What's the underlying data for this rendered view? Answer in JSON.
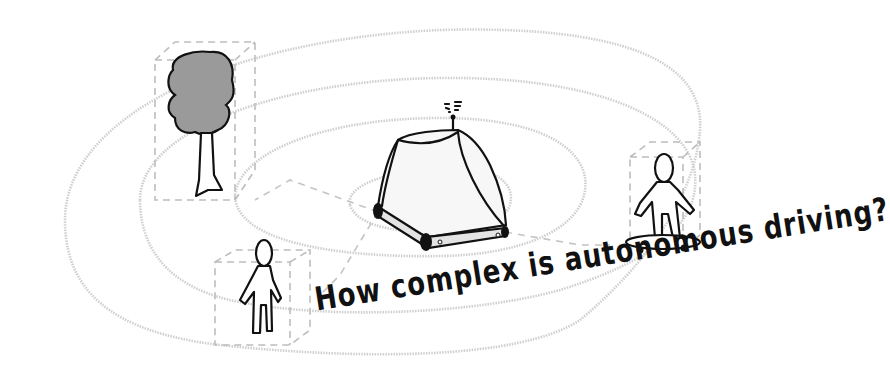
{
  "illustration": {
    "title": "How complex is autonomous driving?",
    "colors": {
      "background": "#ffffff",
      "ink": "#111111",
      "rings": "#cfcfcf",
      "bounding_boxes": "#bdbdbd",
      "tree_canopy": "#9a9a9a",
      "vehicle_bumper": "#e3e3e3"
    },
    "objects": [
      {
        "name": "autonomous-vehicle",
        "label": "vehicle"
      },
      {
        "name": "tree",
        "label": "tree"
      },
      {
        "name": "pedestrian",
        "label": "person"
      },
      {
        "name": "skateboarder",
        "label": "person on skateboard"
      }
    ],
    "rings_count": 4
  }
}
